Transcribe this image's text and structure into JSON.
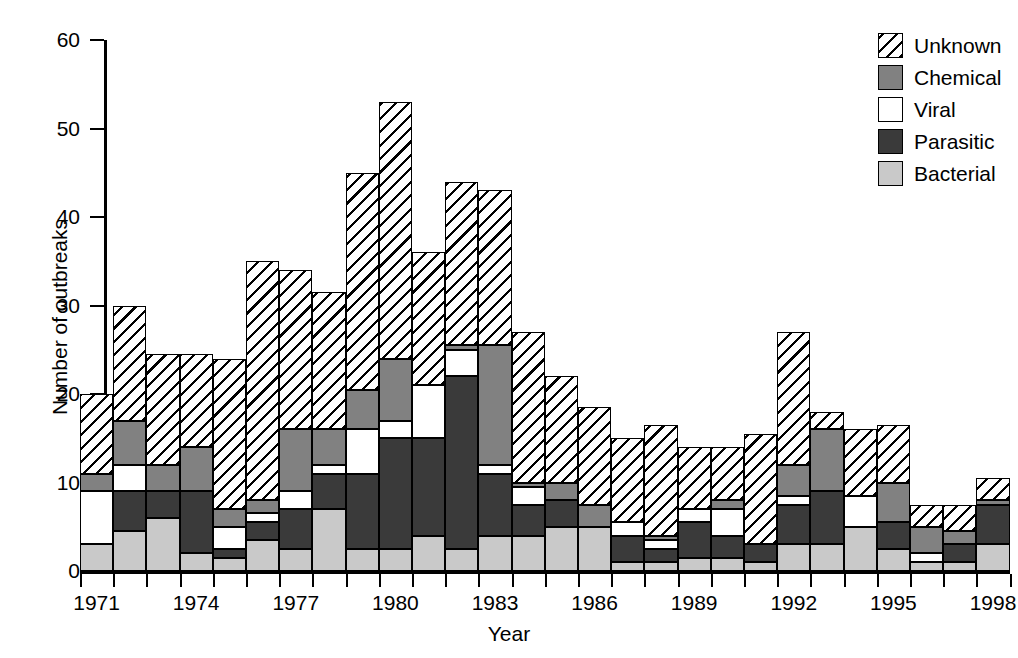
{
  "chart_data": {
    "type": "bar",
    "stacked": true,
    "title": "",
    "xlabel": "Year",
    "ylabel": "Number of outbreaks",
    "ylim": [
      0,
      60
    ],
    "ytick_step": 10,
    "yticks": [
      0,
      10,
      20,
      30,
      40,
      50,
      60
    ],
    "grid": false,
    "legend_position": "top-right",
    "legend_order_top_to_bottom": [
      "Unknown",
      "Chemical",
      "Viral",
      "Parasitic",
      "Bacterial"
    ],
    "stack_order_bottom_to_top": [
      "Bacterial",
      "Parasitic",
      "Viral",
      "Chemical",
      "Unknown"
    ],
    "categories": [
      "1971",
      "1972",
      "1973",
      "1974",
      "1975",
      "1976",
      "1977",
      "1978",
      "1979",
      "1980",
      "1981",
      "1982",
      "1983",
      "1984",
      "1985",
      "1986",
      "1987",
      "1988",
      "1989",
      "1990",
      "1991",
      "1992",
      "1993",
      "1994",
      "1995",
      "1996",
      "1997",
      "1998"
    ],
    "xtick_labels": [
      "1971",
      "1974",
      "1977",
      "1980",
      "1983",
      "1986",
      "1989",
      "1992",
      "1995",
      "1998"
    ],
    "series": [
      {
        "name": "Bacterial",
        "color": "#c9c9c9",
        "pattern": "solid-light-grey",
        "values": [
          3,
          4.5,
          6,
          2,
          1.5,
          3.5,
          2.5,
          7,
          2.5,
          2.5,
          4,
          2.5,
          4,
          4,
          5,
          5,
          1,
          1,
          1.5,
          1.5,
          1,
          3,
          3,
          5,
          2.5,
          1,
          1,
          3
        ]
      },
      {
        "name": "Parasitic",
        "color": "#3a3a3a",
        "pattern": "solid-dark",
        "values": [
          0,
          4.5,
          3,
          7,
          1,
          2,
          4.5,
          4,
          8.5,
          12.5,
          11,
          19.5,
          7,
          3.5,
          3,
          0,
          3,
          1.5,
          4,
          2.5,
          2,
          4.5,
          6,
          0,
          3,
          0,
          2,
          4.5
        ]
      },
      {
        "name": "Viral",
        "color": "#ffffff",
        "pattern": "solid-white",
        "values": [
          6,
          3,
          0,
          0,
          2.5,
          1,
          2,
          1,
          5,
          2,
          6,
          3,
          1,
          2,
          0,
          0,
          1.5,
          1,
          1.5,
          3,
          0,
          1,
          0,
          3.5,
          0,
          1,
          0,
          0
        ]
      },
      {
        "name": "Chemical",
        "color": "#818181",
        "pattern": "solid-mid-grey",
        "values": [
          2,
          5,
          3,
          5,
          2,
          1.5,
          7,
          4,
          4.5,
          7,
          0,
          0.5,
          13.5,
          0.5,
          2,
          2.5,
          0,
          0.5,
          0,
          1,
          0,
          3.5,
          7,
          0,
          4.5,
          3,
          1.5,
          0.5
        ]
      },
      {
        "name": "Unknown",
        "color": "#ffffff",
        "pattern": "diagonal-hatch",
        "values": [
          9,
          13,
          12.5,
          10.5,
          17,
          27,
          18,
          15.5,
          24.5,
          29,
          15,
          18.5,
          17.5,
          17,
          12,
          11,
          9.5,
          12.5,
          7,
          6,
          12.5,
          15,
          2,
          7.5,
          6.5,
          2.5,
          3,
          2.5
        ]
      }
    ],
    "totals": [
      20,
      30,
      24.5,
      24.5,
      24,
      35,
      34,
      31.5,
      45,
      53,
      36,
      44,
      43,
      27,
      22,
      22,
      15,
      16.5,
      14,
      14,
      15.5,
      27,
      18,
      16,
      16.5,
      7.5,
      7.5,
      10.5
    ]
  },
  "legend": {
    "items": [
      {
        "label": "Unknown",
        "swatch": "unknown-swatch"
      },
      {
        "label": "Chemical",
        "swatch": "chemical-swatch"
      },
      {
        "label": "Viral",
        "swatch": "viral-swatch"
      },
      {
        "label": "Parasitic",
        "swatch": "parasitic-swatch"
      },
      {
        "label": "Bacterial",
        "swatch": "bacterial-swatch"
      }
    ]
  }
}
